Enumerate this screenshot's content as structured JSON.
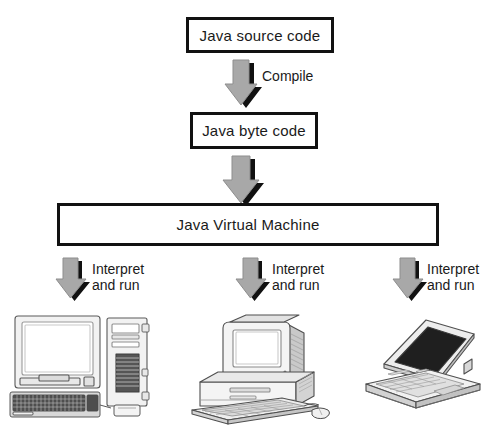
{
  "diagram": {
    "boxes": [
      {
        "id": "source",
        "label": "Java source code"
      },
      {
        "id": "byte",
        "label": "Java byte code"
      },
      {
        "id": "jvm",
        "label": "Java Virtual Machine"
      }
    ],
    "arrows": [
      {
        "id": "compile",
        "label": "Compile",
        "direction": "down"
      },
      {
        "id": "to-jvm",
        "label": "",
        "direction": "down"
      },
      {
        "id": "interpret-1",
        "label": "Interpret\nand run",
        "direction": "down"
      },
      {
        "id": "interpret-2",
        "label": "Interpret\nand run",
        "direction": "down"
      },
      {
        "id": "interpret-3",
        "label": "Interpret\nand run",
        "direction": "down"
      }
    ],
    "targets": [
      {
        "id": "desktop-tower",
        "name": "desktop computer with tower"
      },
      {
        "id": "desktop-flat",
        "name": "desktop computer with flat case"
      },
      {
        "id": "laptop",
        "name": "laptop computer"
      }
    ],
    "colors": {
      "background": "#ffffff",
      "box_border": "#111111",
      "box_fill": "#ffffff",
      "text": "#1a1a1a",
      "arrow_fill": "#a8a8a8",
      "arrow_shadow": "#111111",
      "illustration_line": "#555555",
      "illustration_fill": "#efefef",
      "screen_dark": "#1e1e1e"
    }
  }
}
